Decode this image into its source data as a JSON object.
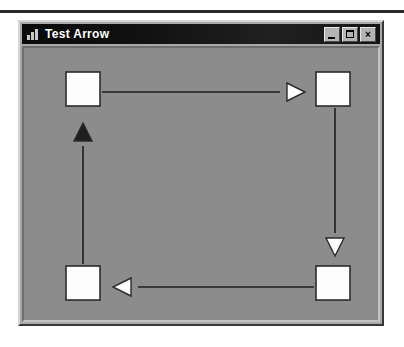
{
  "window": {
    "title": "Test Arrow",
    "icon": "bar-chart-icon",
    "controls": {
      "minimize_label": "_",
      "maximize_label": "□",
      "close_label": "×"
    }
  },
  "canvas": {
    "background_color": "#8c8c8c",
    "node_fill": "#fdfdfd",
    "node_stroke": "#2b2b2b",
    "line_color": "#1e1e1e",
    "nodes": [
      {
        "id": "node-top-left",
        "x": 62,
        "y": 68,
        "w": 34,
        "h": 34
      },
      {
        "id": "node-top-right",
        "x": 312,
        "y": 68,
        "w": 34,
        "h": 34
      },
      {
        "id": "node-bottom-right",
        "x": 312,
        "y": 262,
        "w": 34,
        "h": 34
      },
      {
        "id": "node-bottom-left",
        "x": 62,
        "y": 262,
        "w": 34,
        "h": 34
      }
    ],
    "arrows": [
      {
        "id": "arrow-top-right-direction",
        "direction": "right",
        "fill": "hollow",
        "line": {
          "x1": 98,
          "y1": 88,
          "x2": 276,
          "y2": 88
        },
        "head": {
          "cx": 292,
          "cy": 88,
          "size": 18
        }
      },
      {
        "id": "arrow-right-down-direction",
        "direction": "down",
        "fill": "hollow",
        "line": {
          "x1": 331,
          "y1": 104,
          "x2": 331,
          "y2": 229
        },
        "head": {
          "cx": 331,
          "cy": 243,
          "size": 18
        }
      },
      {
        "id": "arrow-bottom-left-direction",
        "direction": "left",
        "fill": "hollow",
        "line": {
          "x1": 310,
          "y1": 283,
          "x2": 134,
          "y2": 283
        },
        "head": {
          "cx": 118,
          "cy": 283,
          "size": 18
        }
      },
      {
        "id": "arrow-left-up-direction",
        "direction": "up",
        "fill": "solid",
        "line": {
          "x1": 79,
          "y1": 260,
          "x2": 79,
          "y2": 142
        },
        "head": {
          "cx": 79,
          "cy": 128,
          "size": 18
        }
      }
    ]
  }
}
